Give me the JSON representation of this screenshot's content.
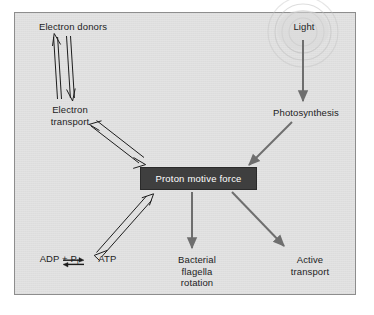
{
  "figure": {
    "background_color": "#e3e3e3",
    "border_color": "#8d8d8d",
    "page_color": "#ffffff"
  },
  "center": {
    "label": "Proton motive force",
    "box_color": "#3f3f3f",
    "text_color": "#ffffff"
  },
  "nodes": [
    {
      "id": "electron-donors",
      "label": "Electron donors"
    },
    {
      "id": "electron-transport",
      "line1": "Electron",
      "line2": "transport"
    },
    {
      "id": "light",
      "label": "Light"
    },
    {
      "id": "photosynthesis",
      "label": "Photosynthesis"
    },
    {
      "id": "atp-equation",
      "reactants": "ADP + P",
      "subscript": "i",
      "arrow": "⇌",
      "product": "ATP"
    },
    {
      "id": "bacterial-flagella",
      "line1": "Bacterial",
      "line2": "flagella",
      "line3": "rotation"
    },
    {
      "id": "active-transport",
      "line1": "Active",
      "line2": "transport"
    }
  ],
  "arrows": [
    {
      "id": "electron-transport-to-donors",
      "from": "Electron transport",
      "to": "Electron donors",
      "style": "open-outline",
      "color": "#1d1d1d",
      "direction": "up"
    },
    {
      "id": "donors-to-electron-transport",
      "from": "Electron donors",
      "to": "Electron transport",
      "style": "open-outline",
      "color": "#1d1d1d",
      "direction": "down"
    },
    {
      "id": "electron-transport-to-pmf",
      "from": "Electron transport",
      "to": "Proton motive force",
      "style": "open-outline-double",
      "color": "#1d1d1d",
      "direction": "bidirectional"
    },
    {
      "id": "light-to-photosynthesis",
      "from": "Light",
      "to": "Photosynthesis",
      "style": "solid",
      "color": "#6e6e6e",
      "direction": "down"
    },
    {
      "id": "photosynthesis-to-pmf",
      "from": "Photosynthesis",
      "to": "Proton motive force",
      "style": "solid",
      "color": "#6e6e6e",
      "direction": "down-left"
    },
    {
      "id": "pmf-to-atp",
      "from": "Proton motive force",
      "to": "ADP + Pi / ATP",
      "style": "open-outline-double",
      "color": "#1d1d1d",
      "direction": "bidirectional"
    },
    {
      "id": "pmf-to-flagella",
      "from": "Proton motive force",
      "to": "Bacterial flagella rotation",
      "style": "solid",
      "color": "#6e6e6e",
      "direction": "down"
    },
    {
      "id": "pmf-to-active-transport",
      "from": "Proton motive force",
      "to": "Active transport",
      "style": "solid",
      "color": "#6e6e6e",
      "direction": "down-right"
    }
  ],
  "decorations": [
    {
      "id": "light-rays",
      "type": "concentric-arcs",
      "count": 4,
      "color": "#b9b9b9",
      "anchor": "light"
    }
  ]
}
